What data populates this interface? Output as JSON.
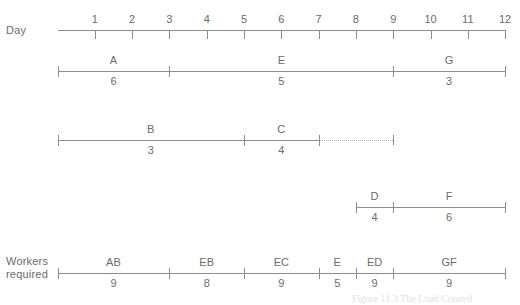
{
  "labels": {
    "day": "Day",
    "workers_required": "Workers\nrequired"
  },
  "caption": "Figure 11.3  The Load Created",
  "colors": {
    "line": "#8d8d8d",
    "text": "#6b6b6b",
    "dotted": "#a8a8a8",
    "background": "#ffffff"
  },
  "chart_data": {
    "type": "gantt",
    "title": "",
    "xlabel": "Day",
    "ylabel": "",
    "axis": {
      "min": 0,
      "max": 12,
      "tick_labels": [
        "1",
        "2",
        "3",
        "4",
        "5",
        "6",
        "7",
        "8",
        "9",
        "10",
        "11",
        "12"
      ],
      "tick_values": [
        1,
        2,
        3,
        4,
        5,
        6,
        7,
        8,
        9,
        10,
        11,
        12
      ],
      "grid": false
    },
    "rows": [
      {
        "row_id": "row-axis",
        "kind": "axis",
        "start": 0,
        "end": 12
      },
      {
        "row_id": "row-aeg",
        "kind": "bar",
        "start": 0,
        "end": 12,
        "segments": [
          {
            "name": "A",
            "value": "6",
            "start": 0,
            "end": 3
          },
          {
            "name": "E",
            "value": "5",
            "start": 3,
            "end": 9
          },
          {
            "name": "G",
            "value": "3",
            "start": 9,
            "end": 12
          }
        ]
      },
      {
        "row_id": "row-bc",
        "kind": "bar",
        "start": 0,
        "end": 7,
        "float_start": 7,
        "float_end": 9,
        "segments": [
          {
            "name": "B",
            "value": "3",
            "start": 0,
            "end": 5
          },
          {
            "name": "C",
            "value": "4",
            "start": 5,
            "end": 7
          }
        ]
      },
      {
        "row_id": "row-df",
        "kind": "bar",
        "start": 8,
        "end": 12,
        "segments": [
          {
            "name": "D",
            "value": "4",
            "start": 8,
            "end": 9
          },
          {
            "name": "F",
            "value": "6",
            "start": 9,
            "end": 12
          }
        ]
      },
      {
        "row_id": "row-workers",
        "kind": "bar",
        "start": 0,
        "end": 12,
        "segments": [
          {
            "name": "AB",
            "value": "9",
            "start": 0,
            "end": 3
          },
          {
            "name": "EB",
            "value": "8",
            "start": 3,
            "end": 5
          },
          {
            "name": "EC",
            "value": "9",
            "start": 5,
            "end": 7
          },
          {
            "name": "E",
            "value": "5",
            "start": 7,
            "end": 8
          },
          {
            "name": "ED",
            "value": "9",
            "start": 8,
            "end": 9
          },
          {
            "name": "GF",
            "value": "9",
            "start": 9,
            "end": 12
          }
        ]
      }
    ]
  }
}
